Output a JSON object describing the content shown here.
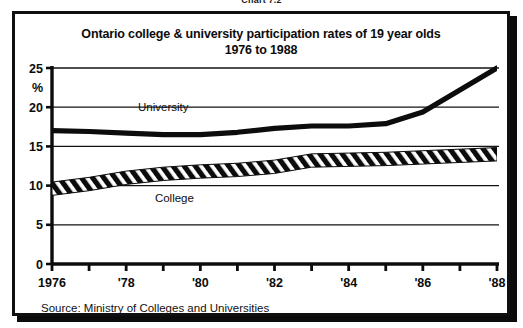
{
  "figure": {
    "label": "Chart 7.2"
  },
  "chart_data": {
    "type": "line",
    "title": "Ontario college & university participation rates of 19 year olds",
    "subtitle": "1976 to 1988",
    "xlabel": "",
    "ylabel": "%",
    "ylim": [
      0,
      25
    ],
    "yticks": [
      0,
      5,
      10,
      15,
      20,
      25
    ],
    "ytick_labels": [
      "0",
      "5",
      "10",
      "15",
      "20",
      "25"
    ],
    "xlim": [
      1976,
      1988
    ],
    "x": [
      1976,
      1977,
      1978,
      1979,
      1980,
      1981,
      1982,
      1983,
      1984,
      1985,
      1986,
      1987,
      1988
    ],
    "xticks": [
      1976,
      1977,
      1978,
      1979,
      1980,
      1981,
      1982,
      1983,
      1984,
      1985,
      1986,
      1987,
      1988
    ],
    "xtick_labels": [
      "1976",
      "",
      "'78",
      "",
      "'80",
      "",
      "'82",
      "",
      "'84",
      "",
      "'86",
      "",
      "'88"
    ],
    "grid": true,
    "grid_axis": "y",
    "legend": "inline-labels",
    "series": [
      {
        "name": "University",
        "style": "solid-thick",
        "color": "#0c0c0c",
        "values": [
          17.0,
          16.9,
          16.7,
          16.5,
          16.5,
          16.8,
          17.3,
          17.6,
          17.6,
          17.9,
          19.4,
          22.2,
          25.0
        ]
      },
      {
        "name": "College",
        "style": "hatched-band",
        "color": "#0c0c0c",
        "values": [
          9.6,
          10.2,
          11.0,
          11.5,
          11.8,
          12.0,
          12.4,
          13.2,
          13.3,
          13.4,
          13.6,
          13.8,
          14.0
        ]
      }
    ],
    "annotations": [
      {
        "text": "University",
        "x": 1979.0,
        "y": 19.5
      },
      {
        "text": "College",
        "x": 1979.3,
        "y": 7.9
      }
    ],
    "source": "Source: Ministry of Colleges and Universities"
  }
}
